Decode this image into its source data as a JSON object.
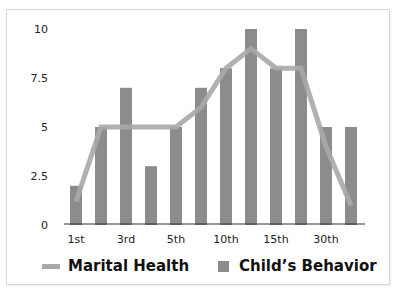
{
  "chart_data": {
    "type": "bar",
    "title": "",
    "xlabel": "",
    "ylabel": "",
    "ylim": [
      0,
      10
    ],
    "yticks": [
      "0",
      "2.5",
      "5",
      "7.5",
      "10"
    ],
    "grid": false,
    "legend_position": "bottom",
    "categories": [
      "1st",
      "",
      "3rd",
      "",
      "5th",
      "",
      "10th",
      "",
      "15th",
      "",
      "30th",
      ""
    ],
    "series": [
      {
        "name": "Child's Behavior",
        "kind": "bar",
        "color": "#8c8c8c",
        "values": [
          2,
          5,
          7,
          3,
          5,
          7,
          8,
          10,
          8,
          10,
          5,
          5
        ]
      },
      {
        "name": "Marital Health",
        "kind": "line",
        "color": "#a8a8a8",
        "values": [
          1.2,
          5,
          5,
          5,
          5,
          6,
          8,
          9,
          8,
          8,
          4,
          1
        ]
      }
    ]
  },
  "legend": {
    "line_label": "Marital Health",
    "bar_label": "Child’s Behavior"
  },
  "colors": {
    "bar": "#8c8c8c",
    "line": "#a8a8a8",
    "axis": "#333333",
    "frame": "#d8d8d8"
  }
}
